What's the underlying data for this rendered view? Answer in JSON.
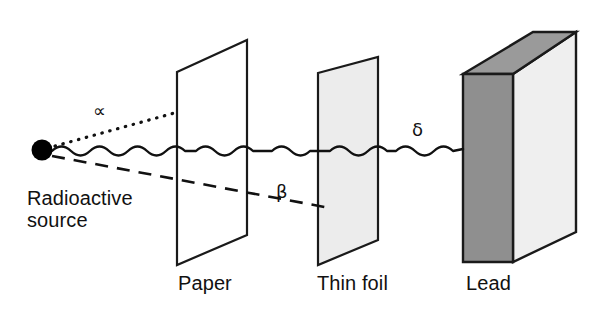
{
  "figure": {
    "background_color": "#ffffff",
    "stroke_color": "#1a1a1a",
    "source": {
      "label_line1": "Radioactive",
      "label_line2": "source",
      "dot_color": "#000000",
      "dot_x": 42,
      "dot_y": 150,
      "dot_radius": 10
    },
    "rays": [
      {
        "name": "alpha",
        "symbol": "∝",
        "line_style": "dotted",
        "stopped_by": "Paper",
        "path": "M 52 146 L 178 112"
      },
      {
        "name": "beta",
        "symbol": "β",
        "line_style": "dashed",
        "stopped_by": "Thin foil",
        "path": "M 52 154 L 330 206"
      },
      {
        "name": "delta",
        "symbol": "δ",
        "line_style": "wavy",
        "stopped_by": "Lead",
        "path": "M 52 151 L 463 148"
      }
    ],
    "barriers": [
      {
        "name": "paper",
        "label": "Paper",
        "fill": "#ffffff",
        "points": "177,72 247,40 247,235 177,265"
      },
      {
        "name": "thin-foil",
        "label": "Thin foil",
        "fill": "#ececec",
        "points": "318,73 378,57 378,240 318,265"
      },
      {
        "name": "lead",
        "label": "Lead",
        "front_fill": "#8f8f8f",
        "side_fill": "#efefef",
        "top_fill": "#9a9a9a",
        "front_points": "463,74 513,74 513,262 463,262",
        "top_points": "463,74 533,32 576,32 513,74",
        "side_points": "513,74 576,32 576,232 513,262"
      }
    ]
  }
}
